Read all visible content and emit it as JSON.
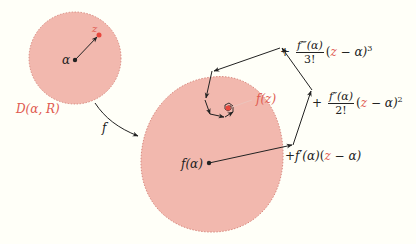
{
  "diagram": {
    "colors": {
      "background": "#fffff8",
      "region_fill": "#f2b8ae",
      "region_stroke": "#d98a80",
      "point_z": "#e8463c",
      "ink": "#222222",
      "accent_text": "#e05a50"
    },
    "domain_disk": {
      "label": "D(α, R)",
      "center_label": "α",
      "point_label": "z"
    },
    "map": {
      "label": "f"
    },
    "image_region": {
      "center_label": "f(α)",
      "target_label": "f(z)"
    },
    "series_terms": [
      {
        "prefix": "+",
        "coef": "f′(α)",
        "factor_open": "(",
        "z": "z",
        "factor_rest": " − α)",
        "power": ""
      },
      {
        "prefix": "+",
        "numerator": "f″(α)",
        "denominator": "2!",
        "factor_open": "(",
        "z": "z",
        "factor_rest": " − α)",
        "power": "2"
      },
      {
        "prefix": "+",
        "numerator": "f‴(α)",
        "denominator": "3!",
        "factor_open": "(",
        "z": "z",
        "factor_rest": " − α)",
        "power": "3"
      }
    ]
  }
}
